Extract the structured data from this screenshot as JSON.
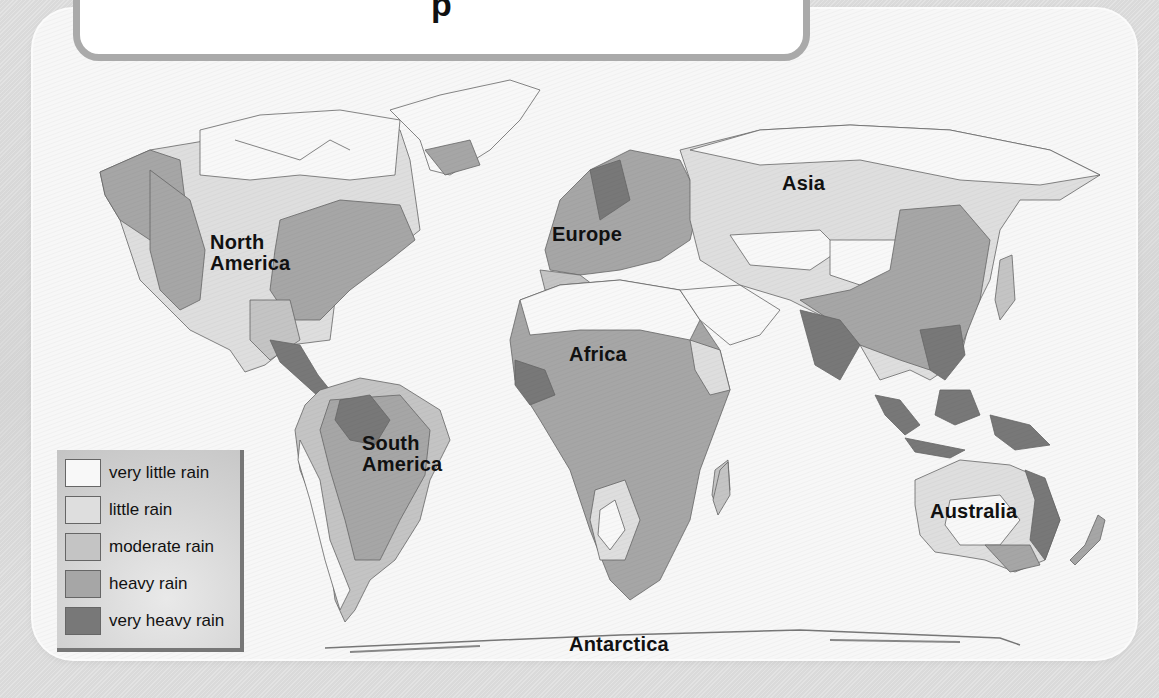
{
  "title": {
    "text": "Precipitation",
    "visible_fragment": "p"
  },
  "map": {
    "type": "world precipitation map",
    "continent_labels": [
      {
        "id": "north-america",
        "line1": "North",
        "line2": "America"
      },
      {
        "id": "south-america",
        "line1": "South",
        "line2": "America"
      },
      {
        "id": "europe",
        "line1": "Europe"
      },
      {
        "id": "africa",
        "line1": "Africa"
      },
      {
        "id": "asia",
        "line1": "Asia"
      },
      {
        "id": "australia",
        "line1": "Australia"
      },
      {
        "id": "antarctica",
        "line1": "Antarctica"
      }
    ]
  },
  "legend": {
    "items": [
      {
        "label": "very little rain",
        "color": "#f8f8f8"
      },
      {
        "label": "little rain",
        "color": "#dedede"
      },
      {
        "label": "moderate rain",
        "color": "#c4c4c4"
      },
      {
        "label": "heavy rain",
        "color": "#a6a6a6"
      },
      {
        "label": "very heavy rain",
        "color": "#787878"
      }
    ]
  }
}
